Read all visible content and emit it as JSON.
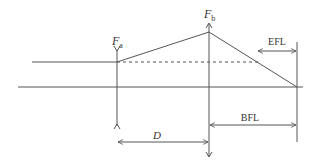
{
  "diagram": {
    "labels": {
      "fa": "F",
      "fa_sub": "a",
      "fb": "F",
      "fb_sub": "b",
      "efl": "EFL",
      "bfl": "BFL",
      "d": "D"
    },
    "colors": {
      "line": "#555555",
      "text": "#333333"
    }
  }
}
